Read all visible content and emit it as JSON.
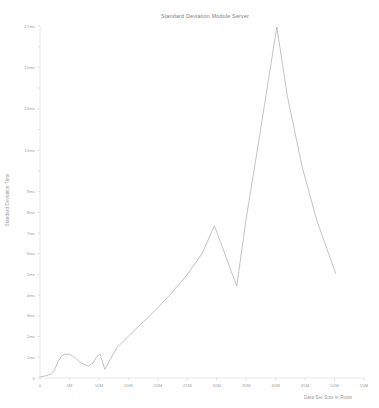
{
  "chart_data": {
    "type": "line",
    "title": "Standard Deviation Module Server",
    "xlabel": "Data Set Size in Rows",
    "ylabel": "Standard Deviation Time",
    "grid": false,
    "legend": false,
    "xlim": [
      0,
      55
    ],
    "ylim": [
      0,
      17
    ],
    "x_unit": "M",
    "y_unit": "ms",
    "x_ticks": [
      0,
      5,
      10,
      15,
      20,
      25,
      30,
      35,
      40,
      45,
      50,
      55
    ],
    "x_tick_labels": [
      "0",
      "5M",
      "10M",
      "15M",
      "20M",
      "25M",
      "30M",
      "35M",
      "40M",
      "45M",
      "50M",
      "55M"
    ],
    "y_ticks": [
      0,
      1,
      2,
      3,
      4,
      5,
      6,
      7,
      8,
      9,
      10,
      11,
      12,
      13,
      14,
      15,
      16,
      17
    ],
    "y_tick_labels": [
      "0",
      "1ms",
      "2ms",
      "3ms",
      "4ms",
      "5ms",
      "6ms",
      "7ms",
      "8ms",
      "9ms",
      "10ms",
      "11ms",
      "12ms",
      "13ms",
      "14ms",
      "15ms",
      "16ms",
      "17ms"
    ],
    "y_tick_labels_shown": [
      "0",
      "1ms",
      "2ms",
      "3ms",
      "4ms",
      "5ms",
      "6ms",
      "7ms",
      "8ms",
      "9ms",
      "11ms",
      "13ms",
      "15ms",
      "17ms"
    ],
    "series": [
      {
        "name": "Standard Deviation Time",
        "color": "#9e9e9e",
        "x": [
          0.0,
          0.6,
          1.2,
          1.8,
          2.4,
          3.0,
          3.6,
          4.2,
          5.0,
          5.8,
          6.6,
          7.4,
          8.2,
          9.0,
          9.6,
          10.2,
          11.0,
          13.0,
          16.0,
          19.0,
          22.0,
          25.0,
          27.5,
          29.6,
          31.0,
          32.4,
          33.4,
          35.0,
          37.0,
          39.0,
          40.2,
          42.0,
          44.5,
          47.0,
          50.2
        ],
        "y": [
          0.05,
          0.08,
          0.12,
          0.2,
          0.35,
          0.75,
          1.05,
          1.15,
          1.15,
          1.0,
          0.82,
          0.66,
          0.58,
          0.72,
          1.02,
          1.15,
          0.42,
          1.45,
          2.3,
          3.1,
          4.0,
          5.0,
          6.0,
          7.35,
          6.3,
          5.2,
          4.45,
          7.7,
          11.2,
          14.8,
          16.95,
          13.6,
          10.2,
          7.6,
          5.05
        ]
      }
    ]
  },
  "meta": {
    "background_color": "#ffffff",
    "line_color": "#9e9e9e",
    "text_color": "#8a8a8a"
  }
}
